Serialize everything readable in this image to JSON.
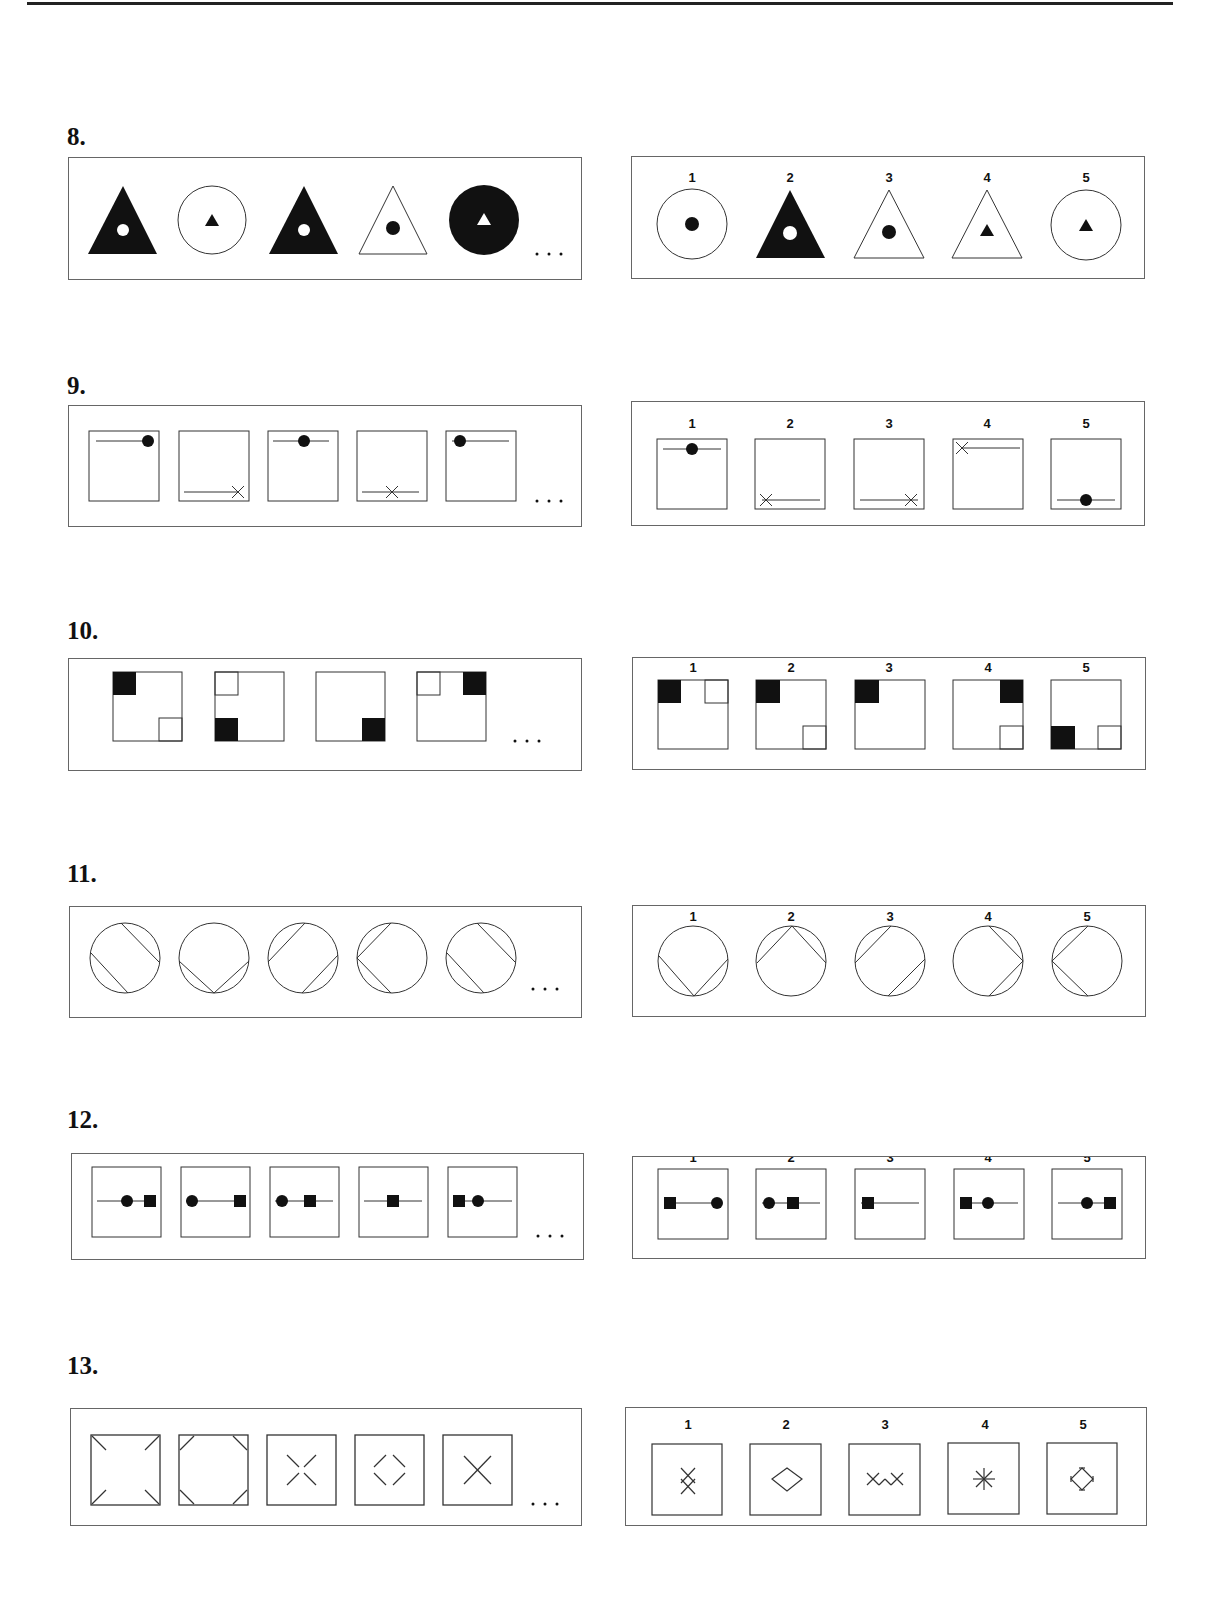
{
  "questions": [
    {
      "number": "8.",
      "sequence": [
        "black triangle with white dot",
        "white circle with black triangle",
        "black triangle with white dot",
        "white triangle with black dot",
        "black circle with white triangle"
      ],
      "continuation": "...",
      "option_labels": [
        "1",
        "2",
        "3",
        "4",
        "5"
      ],
      "options": [
        "white circle with black dot",
        "black triangle with white dot",
        "white triangle with black dot",
        "white triangle with black triangle",
        "white circle with black triangle"
      ]
    },
    {
      "number": "9.",
      "sequence": [
        "top line, dot right",
        "bottom line, cross right",
        "top line, dot center",
        "bottom line, cross center",
        "top line, dot left"
      ],
      "continuation": "...",
      "option_labels": [
        "1",
        "2",
        "3",
        "4",
        "5"
      ],
      "options": [
        "top line, dot center",
        "bottom line, cross left",
        "bottom line, cross right",
        "top line, cross left",
        "bottom line, dot center"
      ]
    },
    {
      "number": "10.",
      "sequence": [
        "black TL, white BR",
        "white TL, black BL",
        "black BR",
        "white TL, black TR"
      ],
      "continuation": "...",
      "option_labels": [
        "1",
        "2",
        "3",
        "4",
        "5"
      ],
      "options": [
        "black TL, white TR",
        "black TL, white BR",
        "black TL",
        "black TR, white BR",
        "black BL, white BR"
      ]
    },
    {
      "number": "11.",
      "sequence": [
        "chords NE and SW",
        "chords SW and SE",
        "chords NW and SE",
        "chords NW and SW",
        "chords NE and SW"
      ],
      "continuation": "...",
      "option_labels": [
        "1",
        "2",
        "3",
        "4",
        "5"
      ],
      "options": [
        "chords SW and SE",
        "chords NW and NE",
        "chords NW and SE",
        "chords NE and SE",
        "chords NW and SW"
      ]
    },
    {
      "number": "12.",
      "sequence": [
        "line, circle, square right",
        "circle left, square right",
        "circle, square, line",
        "line, square center",
        "square, circle, line"
      ],
      "continuation": "...",
      "option_labels": [
        "1",
        "2",
        "3",
        "4",
        "5"
      ],
      "options": [
        "square left, circle right",
        "circle, square, line",
        "square left, line",
        "square, circle, line",
        "line, circle, square right"
      ]
    },
    {
      "number": "13.",
      "sequence": [
        "corner strokes inward",
        "corner strokes cut",
        "X strokes center",
        "diamond strokes",
        "X cross"
      ],
      "continuation": "...",
      "option_labels": [
        "1",
        "2",
        "3",
        "4",
        "5"
      ],
      "options": [
        "stacked crosses vertical",
        "diamond",
        "crosses horizontal",
        "asterisk",
        "diamond with ticks"
      ]
    }
  ],
  "colors": {
    "ink": "#111111",
    "border": "#666666",
    "paper": "#ffffff"
  }
}
